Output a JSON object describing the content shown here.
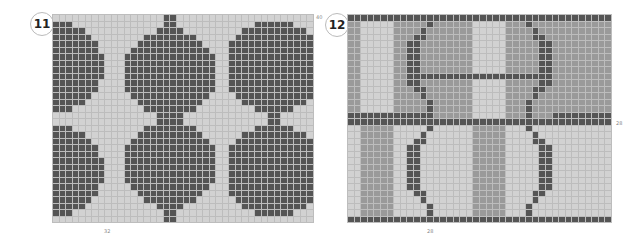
{
  "charts": [
    {
      "number": "11",
      "cols": 40,
      "rows": 32,
      "width_label": "32",
      "height_label": "40",
      "colors": {
        "dark": "#555555",
        "light": "#d2d2d2"
      }
    },
    {
      "number": "12",
      "cols": 40,
      "rows": 32,
      "width_label": "28",
      "height_label": "28",
      "colors": {
        "dark": "#555555",
        "medium": "#9a9a9a",
        "light": "#d2d2d2"
      }
    }
  ]
}
